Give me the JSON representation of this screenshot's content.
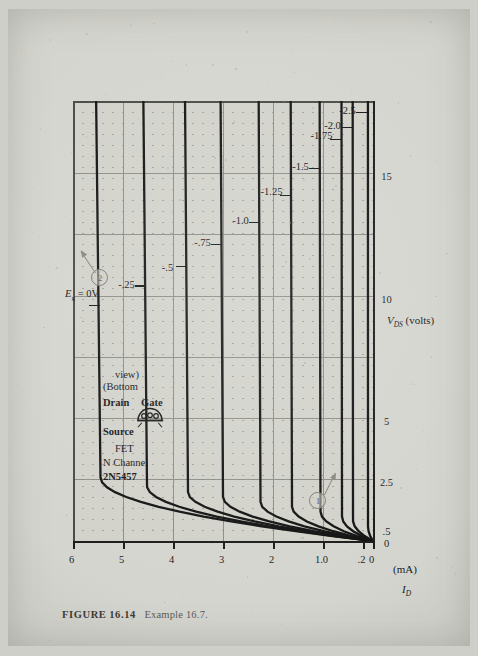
{
  "figure": {
    "label": "FIGURE",
    "number": "16.14",
    "example": "Example 16.7."
  },
  "legend": {
    "part_number": "2N5457",
    "channel": "N Channel",
    "device": "FET",
    "pin_source": "Source",
    "pin_drain": "Drain",
    "pin_gate": "Gate",
    "view_line1": "(Bottom",
    "view_line2": "view)",
    "package_icon": "to92-bottom-view-icon"
  },
  "callouts": [
    {
      "id": "callout-1",
      "label": "1"
    },
    {
      "id": "callout-2",
      "label": "2"
    }
  ],
  "chart_data": {
    "type": "line",
    "title": "",
    "xlabel": "V_DS (volts)",
    "xlabel_parts": {
      "symbol": "V",
      "sub": "DS",
      "unit": "(volts)"
    },
    "ylabel": "I_D (mA)",
    "ylabel_parts": {
      "symbol": "I",
      "sub": "D",
      "unit": "(mA)"
    },
    "xlim": [
      0,
      18
    ],
    "ylim": [
      0,
      6
    ],
    "grid": true,
    "minor_grid": "dotted",
    "legend_position": "inline-curve-labels",
    "xticks": [
      {
        "value": 0,
        "label": "0"
      },
      {
        "value": 0.5,
        "label": ".5"
      },
      {
        "value": 2.5,
        "label": "2.5"
      },
      {
        "value": 5,
        "label": "5"
      },
      {
        "value": 10,
        "label": "10"
      },
      {
        "value": 15,
        "label": "15"
      }
    ],
    "yticks": [
      {
        "value": 0,
        "label": "0"
      },
      {
        "value": 0.2,
        "label": ".2"
      },
      {
        "value": 1.0,
        "label": "1.0"
      },
      {
        "value": 2,
        "label": "2"
      },
      {
        "value": 3,
        "label": "3"
      },
      {
        "value": 4,
        "label": "4"
      },
      {
        "value": 5,
        "label": "5"
      },
      {
        "value": 6,
        "label": "6"
      }
    ],
    "xmajor_gridlines": [
      2.5,
      5,
      7.5,
      10,
      12.5,
      15
    ],
    "ymajor_gridlines": [
      1,
      2,
      3,
      4,
      5
    ],
    "series": [
      {
        "name": "Eg = 0V",
        "label": "E",
        "label_sub": "g",
        "label_tail": " = 0V",
        "vgs": 0.0,
        "idss_sat": 5.45,
        "vp_knee": 2.6,
        "label_x": 9.6,
        "label_y": 5.45
      },
      {
        "name": "-.25",
        "vgs": -0.25,
        "idss_sat": 4.52,
        "vp_knee": 2.25,
        "label_x": 10.4,
        "label_y": 4.52
      },
      {
        "name": "-.5",
        "vgs": -0.5,
        "idss_sat": 3.7,
        "vp_knee": 2.0,
        "label_x": 11.2,
        "label_y": 3.7
      },
      {
        "name": "-.75",
        "vgs": -0.75,
        "idss_sat": 3.0,
        "vp_knee": 1.8,
        "label_x": 12.1,
        "label_y": 3.0
      },
      {
        "name": "-1.0",
        "vgs": -1.0,
        "idss_sat": 2.25,
        "vp_knee": 1.6,
        "label_x": 13.0,
        "label_y": 2.25
      },
      {
        "name": "-1.25",
        "vgs": -1.25,
        "idss_sat": 1.62,
        "vp_knee": 1.4,
        "label_x": 14.1,
        "label_y": 1.62
      },
      {
        "name": "-1.5",
        "vgs": -1.5,
        "idss_sat": 1.05,
        "vp_knee": 1.2,
        "label_x": 15.2,
        "label_y": 1.05
      },
      {
        "name": "-1.75",
        "vgs": -1.75,
        "idss_sat": 0.62,
        "vp_knee": 1.0,
        "label_x": 16.4,
        "label_y": 0.62
      },
      {
        "name": "-2.0",
        "vgs": -2.0,
        "idss_sat": 0.4,
        "vp_knee": 0.85,
        "label_x": 16.9,
        "label_y": 0.4
      },
      {
        "name": "-2.5",
        "vgs": -2.5,
        "idss_sat": 0.1,
        "vp_knee": 0.6,
        "label_x": 17.5,
        "label_y": 0.1
      }
    ]
  }
}
